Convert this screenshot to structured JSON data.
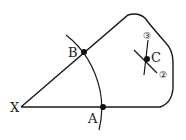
{
  "diagram": {
    "type": "geometric-construction",
    "stroke_color": "#1a1a1a",
    "background": "#ffffff",
    "points": {
      "X": {
        "label": "X",
        "x": 21,
        "y": 107
      },
      "A": {
        "label": "A",
        "x": 103,
        "y": 107
      },
      "B": {
        "label": "B",
        "x": 84,
        "y": 52
      },
      "C": {
        "label": "C",
        "x": 147,
        "y": 59
      }
    },
    "arc_marks": {
      "mark_2": {
        "label": "②"
      },
      "mark_3": {
        "label": "③"
      }
    }
  }
}
